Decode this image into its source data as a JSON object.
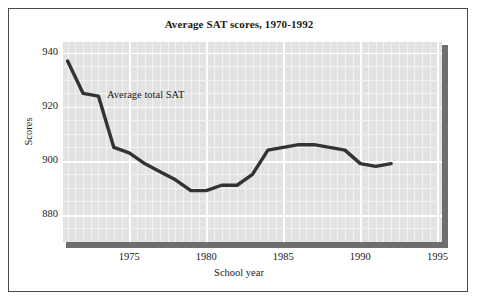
{
  "figure": {
    "title": "Average SAT scores, 1970-1992",
    "annotation": "Average total SAT",
    "border_color": "#4a4a4a",
    "plot_background": "#e2e2e2",
    "gridline_color": "#ffffff",
    "line_color": "#333333",
    "shadow_color": "#6e6e6e"
  },
  "axes": {
    "y_title": "Scores",
    "x_title": "School year",
    "y_ticks": [
      880,
      900,
      920,
      940
    ],
    "y_tick_labels": [
      "880",
      "900",
      "920",
      "940"
    ],
    "x_ticks": [
      1975,
      1980,
      1985,
      1990,
      1995
    ],
    "x_tick_labels": [
      "1975",
      "1980",
      "1985",
      "1990",
      "1995"
    ],
    "ylim": [
      870,
      944
    ],
    "xlim": [
      1970.7,
      1995.3
    ]
  },
  "chart_data": {
    "type": "line",
    "title": "Average SAT scores, 1970-1992",
    "xlabel": "School year",
    "ylabel": "Scores",
    "xlim": [
      1970.7,
      1995.3
    ],
    "ylim": [
      870,
      944
    ],
    "grid": true,
    "legend_position": "inline-annotation",
    "series": [
      {
        "name": "Average total SAT",
        "x": [
          1971,
          1972,
          1973,
          1974,
          1975,
          1976,
          1977,
          1978,
          1979,
          1980,
          1981,
          1982,
          1983,
          1984,
          1985,
          1986,
          1987,
          1988,
          1989,
          1990,
          1991,
          1992
        ],
        "values": [
          937,
          925,
          924,
          905,
          903,
          899,
          896,
          893,
          889,
          889,
          891,
          891,
          895,
          904,
          905,
          906,
          906,
          905,
          904,
          899,
          898,
          899
        ]
      }
    ]
  }
}
